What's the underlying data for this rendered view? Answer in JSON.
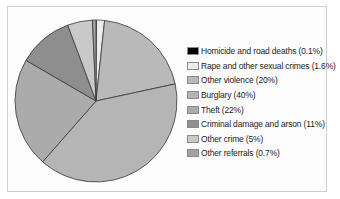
{
  "chart_data": {
    "type": "pie",
    "title": "",
    "categories": [
      "Homicide and road deaths",
      "Rape and other sexual crimes",
      "Other violence",
      "Burglary",
      "Theft",
      "Criminal damage and arson",
      "Other crime",
      "Other referrals"
    ],
    "values": [
      0.1,
      1.6,
      20,
      40,
      22,
      11,
      5,
      0.7
    ],
    "unit": "%",
    "start_angle": "12 o'clock",
    "direction": "clockwise",
    "legend_position": "right",
    "colors": [
      "#000000",
      "#ececec",
      "#b9b9b9",
      "#b5b5b5",
      "#ababab",
      "#8e8e8e",
      "#c9c9c9",
      "#a3a3a3"
    ]
  },
  "legend": {
    "items": [
      {
        "label": "Homicide and road deaths (0.1%)",
        "color": "#000000"
      },
      {
        "label": "Rape and other sexual crimes (1.6%)",
        "color": "#ececec"
      },
      {
        "label": "Other violence (20%)",
        "color": "#b9b9b9"
      },
      {
        "label": "Burglary (40%)",
        "color": "#b5b5b5"
      },
      {
        "label": "Theft (22%)",
        "color": "#ababab"
      },
      {
        "label": "Criminal damage and arson (11%)",
        "color": "#8e8e8e"
      },
      {
        "label": "Other crime (5%)",
        "color": "#c9c9c9"
      },
      {
        "label": "Other referrals (0.7%)",
        "color": "#a3a3a3"
      }
    ]
  }
}
